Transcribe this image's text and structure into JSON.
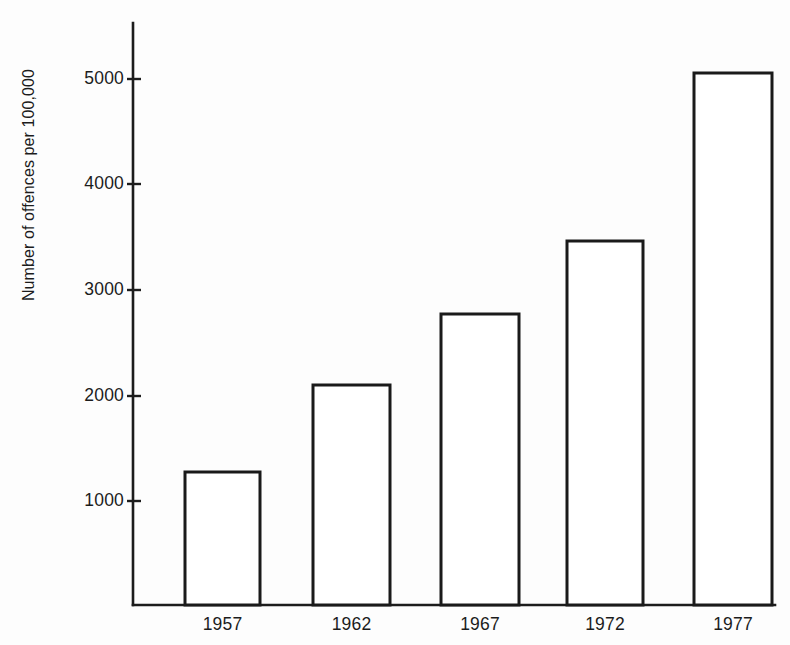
{
  "chart_data": {
    "type": "bar",
    "title": "",
    "subtitle": "",
    "xlabel": "",
    "ylabel": "Number of offences per 100,000",
    "categories": [
      "1957",
      "1962",
      "1967",
      "1972",
      "1977"
    ],
    "values": [
      1260,
      2090,
      2760,
      3450,
      5050
    ],
    "series": [
      {
        "name": "Number of offences per 100,000",
        "values": [
          1260,
          2090,
          2760,
          3450,
          5050
        ]
      }
    ],
    "ylim": [
      0,
      5300
    ],
    "xlim_note": "categorical",
    "ytick_labels": [
      "1000",
      "2000",
      "3000",
      "4000",
      "5000"
    ],
    "ytick_values": [
      1000,
      2000,
      3000,
      4000,
      5000
    ],
    "grid": false,
    "legend": false,
    "legend_position": "none",
    "annotations": [],
    "style": {
      "background_color": "#fdfdfd",
      "axis_color": "#1c1c1c",
      "bar_fill_color": "#ffffff",
      "bar_outline_color": "#1a1a1a",
      "text_color": "#1c1c1c"
    }
  },
  "geometry": {
    "axis_x": 133,
    "axis_top_y": 23,
    "baseline_y": 605,
    "axis_right_x": 775,
    "px_per_1000": 105.5,
    "bars": [
      {
        "label": "1957",
        "x0": 185,
        "x1": 260,
        "top_y": 472
      },
      {
        "label": "1962",
        "x0": 313,
        "x1": 390,
        "top_y": 385
      },
      {
        "label": "1967",
        "x0": 441,
        "x1": 519,
        "top_y": 314
      },
      {
        "label": "1972",
        "x0": 567,
        "x1": 643,
        "top_y": 241
      },
      {
        "label": "1977",
        "x0": 694,
        "x1": 772,
        "top_y": 73
      }
    ],
    "ytick_y": {
      "1000": 501,
      "2000": 396,
      "3000": 290,
      "4000": 184,
      "5000": 79
    },
    "tick_label_right_x": 124,
    "tick_mark_x0": 127,
    "tick_mark_x1": 141,
    "cat_label_y": 617,
    "ylabel_x": 34,
    "ylabel_y": 185
  }
}
